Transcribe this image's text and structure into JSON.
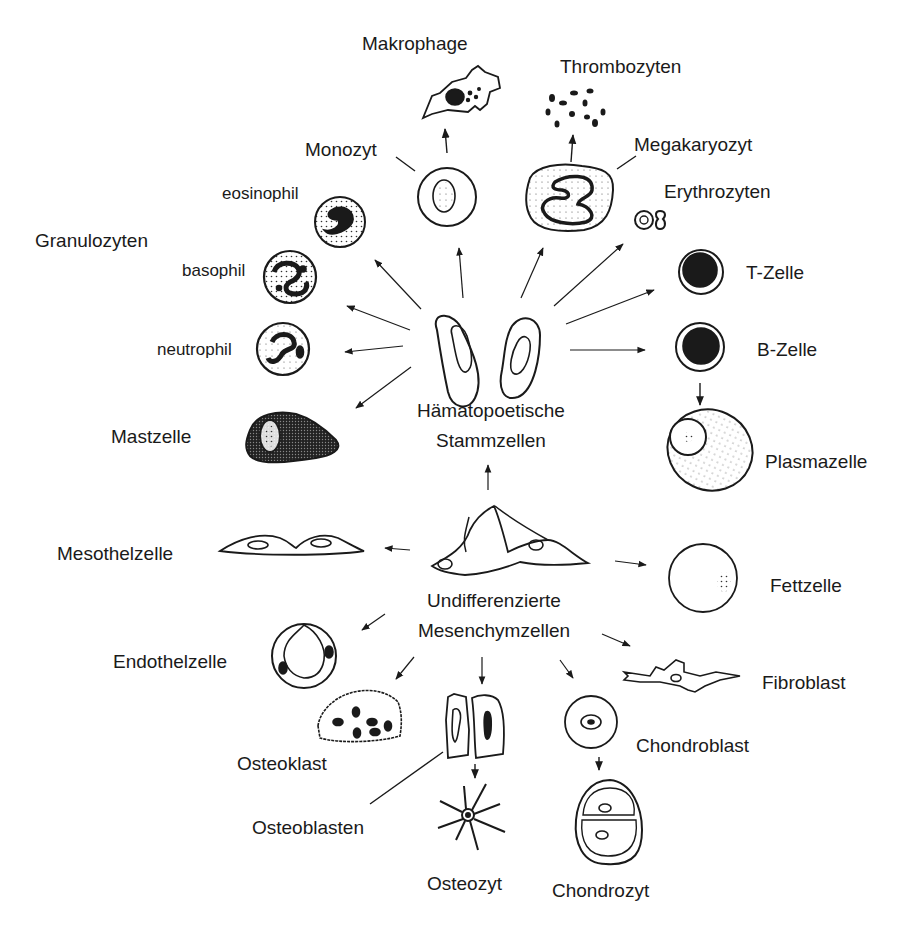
{
  "diagram": {
    "topic": "Zelldifferenzierung aus Stammzellen",
    "sources": {
      "hematopoietic": {
        "line1": "Hämatopoetische",
        "line2": "Stammzellen"
      },
      "mesenchymal": {
        "line1": "Undifferenzierte",
        "line2": "Mesenchymzellen"
      }
    },
    "labels": {
      "makrophage": "Makrophage",
      "thrombozyten": "Thrombozyten",
      "monozyt": "Monozyt",
      "megakaryozyt": "Megakaryozyt",
      "erythrozyten": "Erythrozyten",
      "eosinophil": "eosinophil",
      "granulozyten": "Granulozyten",
      "basophil": "basophil",
      "neutrophil": "neutrophil",
      "mastzelle": "Mastzelle",
      "t_zelle": "T-Zelle",
      "b_zelle": "B-Zelle",
      "plasmazelle": "Plasmazelle",
      "mesothelzelle": "Mesothelzelle",
      "fettzelle": "Fettzelle",
      "endothelzelle": "Endothelzelle",
      "fibroblast": "Fibroblast",
      "osteoklast": "Osteoklast",
      "chondroblast": "Chondroblast",
      "osteoblasten": "Osteoblasten",
      "osteozyt": "Osteozyt",
      "chondrozyt": "Chondrozyt"
    },
    "colors": {
      "ink": "#1a1a1a",
      "background": "#ffffff"
    }
  }
}
